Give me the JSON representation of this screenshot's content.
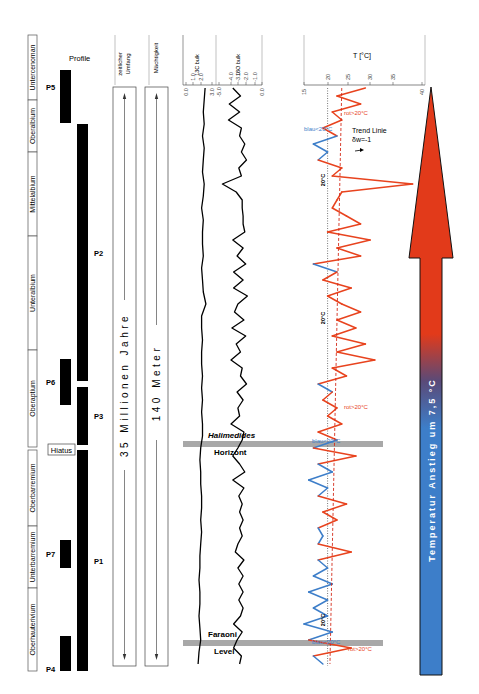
{
  "chart_data": {
    "type": "line",
    "title": "",
    "stratigraphy": {
      "stages": [
        {
          "label": "Untercenoman",
          "y0": 35,
          "y1": 100
        },
        {
          "label": "Oberalbium",
          "y0": 100,
          "y1": 152
        },
        {
          "label": "Mittelalbium",
          "y0": 152,
          "y1": 236
        },
        {
          "label": "Unteralbium",
          "y0": 236,
          "y1": 350
        },
        {
          "label": "Oberaptium",
          "y0": 350,
          "y1": 447
        },
        {
          "label": "Oberbarremium",
          "y0": 450,
          "y1": 526
        },
        {
          "label": "Unterbarremium",
          "y0": 526,
          "y1": 588
        },
        {
          "label": "Oberhauterivium",
          "y0": 588,
          "y1": 671
        }
      ],
      "hiatus_label": "Hiatus"
    },
    "profiles": {
      "header": "Profile",
      "bars": [
        {
          "label": "P5",
          "col": 0,
          "y0": 70,
          "y1": 123
        },
        {
          "label": "P2",
          "col": 1,
          "y0": 124,
          "y1": 381
        },
        {
          "label": "P6",
          "col": 0,
          "y0": 359,
          "y1": 405
        },
        {
          "label": "P3",
          "col": 1,
          "y0": 387,
          "y1": 445
        },
        {
          "label": "P1",
          "col": 1,
          "y0": 450,
          "y1": 671
        },
        {
          "label": "P7",
          "col": 0,
          "y0": 540,
          "y1": 568
        },
        {
          "label": "P4",
          "col": 0,
          "y0": 636,
          "y1": 671
        }
      ]
    },
    "time_column": {
      "header": "zeitlicher Umfang",
      "label": "35 Millionen Jahre"
    },
    "thickness_column": {
      "header": "Mächtigkeit",
      "label": "140 Meter"
    },
    "d13C": {
      "header": "13C bulk",
      "ticks": [
        "0.0",
        "1.0",
        "2.0",
        "3.0"
      ],
      "xlim": [
        0,
        3
      ],
      "depth_y": [
        88,
        100,
        112,
        124,
        136,
        148,
        160,
        172,
        184,
        196,
        208,
        220,
        232,
        244,
        256,
        268,
        280,
        292,
        304,
        316,
        328,
        340,
        352,
        364,
        376,
        388,
        400,
        412,
        424,
        436,
        448,
        460,
        472,
        484,
        496,
        508,
        520,
        532,
        544,
        556,
        568,
        580,
        592,
        604,
        616,
        628,
        640,
        652,
        664
      ],
      "values": [
        2.2,
        2.1,
        2.0,
        2.1,
        1.9,
        2.1,
        2.0,
        1.9,
        2.1,
        2.0,
        1.8,
        2.0,
        1.9,
        1.9,
        2.0,
        1.8,
        1.9,
        2.0,
        2.3,
        1.8,
        1.8,
        1.9,
        1.8,
        1.8,
        1.9,
        1.8,
        1.9,
        1.8,
        1.9,
        1.9,
        1.7,
        1.6,
        1.7,
        1.7,
        1.8,
        1.8,
        1.7,
        1.8,
        1.7,
        1.6,
        1.6,
        1.5,
        1.6,
        1.6,
        1.5,
        1.6,
        1.7,
        1.5,
        1.4
      ]
    },
    "d18O": {
      "header": "18O bulk",
      "ticks": [
        "-5.0",
        "-4.0",
        "-3.0",
        "-2.0",
        "-1.0",
        "0.0"
      ],
      "xlim": [
        -5,
        0
      ],
      "depth_y": [
        88,
        96,
        104,
        112,
        120,
        128,
        136,
        144,
        152,
        160,
        168,
        176,
        184,
        192,
        200,
        208,
        216,
        224,
        232,
        240,
        248,
        256,
        264,
        272,
        280,
        288,
        296,
        304,
        312,
        320,
        328,
        336,
        344,
        352,
        360,
        368,
        376,
        384,
        392,
        400,
        408,
        416,
        424,
        432,
        440,
        448,
        456,
        464,
        472,
        480,
        488,
        496,
        504,
        512,
        520,
        528,
        536,
        544,
        552,
        560,
        568,
        576,
        584,
        592,
        600,
        608,
        616,
        624,
        632,
        640,
        648,
        656,
        664
      ],
      "values": [
        -3.4,
        -2.5,
        -3.8,
        -2.6,
        -3.9,
        -2.4,
        -2.6,
        -2.0,
        -2.4,
        -1.8,
        -2.7,
        -2.4,
        -4.6,
        -3.0,
        -2.3,
        -2.3,
        -2.2,
        -2.2,
        -2.0,
        -3.4,
        -2.2,
        -2.9,
        -1.9,
        -3.3,
        -2.2,
        -3.3,
        -1.7,
        -2.8,
        -3.2,
        -2.1,
        -3.5,
        -1.9,
        -3.0,
        -2.5,
        -3.6,
        -2.3,
        -2.5,
        -1.8,
        -2.9,
        -2.2,
        -2.8,
        -2.6,
        -3.6,
        -2.1,
        -2.3,
        -2.8,
        -3.4,
        -2.6,
        -2.0,
        -3.4,
        -2.1,
        -2.7,
        -2.3,
        -2.6,
        -2.2,
        -2.6,
        -2.3,
        -2.8,
        -3.1,
        -2.1,
        -2.8,
        -2.2,
        -2.7,
        -2.2,
        -2.7,
        -2.2,
        -2.5,
        -3.3,
        -2.3,
        -2.9,
        -3.3,
        -2.4,
        -2.6
      ]
    },
    "temperature": {
      "header": "T [°C]",
      "ticks": [
        "15",
        "20",
        "25",
        "30",
        "35",
        "40"
      ],
      "xlim": [
        15,
        40
      ],
      "threshold": 20,
      "warm_color": "#e8431e",
      "cool_color": "#3d7ec9",
      "depth_y": [
        88,
        96,
        104,
        112,
        120,
        128,
        136,
        144,
        152,
        160,
        168,
        176,
        184,
        192,
        200,
        208,
        216,
        224,
        232,
        240,
        248,
        256,
        264,
        272,
        280,
        288,
        296,
        304,
        312,
        320,
        328,
        336,
        344,
        352,
        360,
        368,
        376,
        384,
        392,
        400,
        408,
        416,
        424,
        432,
        440,
        448,
        456,
        464,
        472,
        480,
        488,
        496,
        504,
        512,
        520,
        528,
        536,
        544,
        552,
        560,
        568,
        576,
        584,
        592,
        600,
        608,
        616,
        624,
        632,
        640,
        648,
        656,
        664
      ],
      "values": [
        28,
        22,
        27,
        21,
        23,
        19,
        22,
        17,
        20,
        18,
        23,
        21,
        38,
        23,
        22,
        21,
        24,
        27,
        20,
        29,
        22,
        27,
        17,
        22,
        19,
        25,
        20,
        23,
        27,
        22,
        26,
        21,
        28,
        22,
        30,
        21,
        24,
        18,
        21,
        19,
        22,
        20,
        23,
        18,
        22,
        17,
        26,
        18,
        21,
        16,
        20,
        18,
        24,
        19,
        22,
        18,
        19,
        18,
        25,
        18,
        20,
        17,
        21,
        16,
        20,
        17,
        20,
        15,
        21,
        16,
        25,
        17,
        19
      ],
      "trend_line": {
        "label": "Trend Linie",
        "slope_label": "δw=-1",
        "y_top": 88,
        "t_top": 23,
        "y_bottom": 664,
        "t_bottom": 20.5
      },
      "annotations": [
        {
          "text": "rot>20°C",
          "x": 344,
          "y": 115,
          "color": "#e8431e"
        },
        {
          "text": "blau<20°C",
          "x": 304,
          "y": 131,
          "color": "#3d7ec9"
        },
        {
          "text": "rot>20°C",
          "x": 344,
          "y": 409,
          "color": "#e8431e"
        },
        {
          "text": "blau<20°C",
          "x": 312,
          "y": 443,
          "color": "#3d7ec9"
        },
        {
          "text": "blau<20°C",
          "x": 312,
          "y": 644,
          "color": "#3d7ec9"
        },
        {
          "text": "rot>20°C",
          "x": 348,
          "y": 651,
          "color": "#e8431e"
        }
      ],
      "threshold_labels": [
        {
          "text": "20°C",
          "y": 180
        },
        {
          "text": "20°C",
          "y": 318
        },
        {
          "text": "20°C",
          "y": 620
        }
      ]
    },
    "horizons": [
      {
        "label_top": "Halimedides",
        "label_bottom": "Horizont",
        "y": 444
      },
      {
        "label_top": "Faraoni",
        "label_bottom": "Level",
        "y": 643
      }
    ],
    "arrow": {
      "label": "Temperatur Anstieg um 7,5 °C",
      "top_color": "#e23a1a",
      "bottom_color": "#3d7ec9"
    }
  }
}
